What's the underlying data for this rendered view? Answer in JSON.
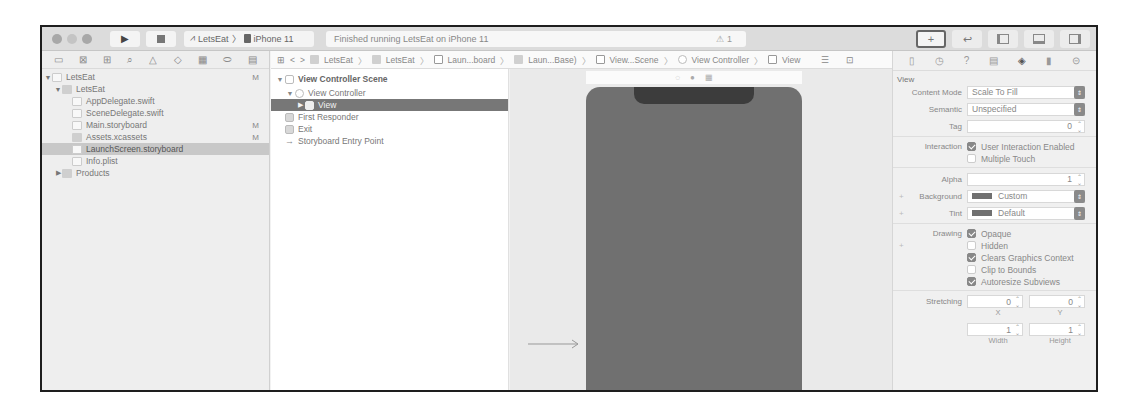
{
  "toolbar": {
    "run_icon": "play-icon",
    "stop_icon": "stop-icon",
    "scheme": {
      "target": "LetsEat",
      "device": "iPhone 11"
    },
    "status": "Finished running LetsEat on iPhone 11",
    "warning_count": "1",
    "right_buttons": [
      "library-icon",
      "code-review-icon",
      "navigator-toggle-icon",
      "debug-area-toggle-icon",
      "inspector-toggle-icon"
    ]
  },
  "navigator": {
    "tab_icons": [
      "folder-icon",
      "source-control-icon",
      "symbol-icon",
      "find-icon",
      "issue-icon",
      "test-icon",
      "debug-icon",
      "breakpoint-icon",
      "report-icon"
    ],
    "items": [
      {
        "label": "LetsEat",
        "level": 0,
        "expanded": true,
        "type": "project",
        "badge": "M"
      },
      {
        "label": "LetsEat",
        "level": 1,
        "expanded": true,
        "type": "folder",
        "badge": ""
      },
      {
        "label": "AppDelegate.swift",
        "level": 2,
        "type": "swift",
        "badge": ""
      },
      {
        "label": "SceneDelegate.swift",
        "level": 2,
        "type": "swift",
        "badge": ""
      },
      {
        "label": "Main.storyboard",
        "level": 2,
        "type": "storyboard",
        "badge": "M"
      },
      {
        "label": "Assets.xcassets",
        "level": 2,
        "type": "assets",
        "badge": "M"
      },
      {
        "label": "LaunchScreen.storyboard",
        "level": 2,
        "type": "storyboard",
        "badge": "",
        "selected": true
      },
      {
        "label": "Info.plist",
        "level": 2,
        "type": "plist",
        "badge": ""
      },
      {
        "label": "Products",
        "level": 1,
        "expanded": false,
        "type": "folder",
        "badge": ""
      }
    ]
  },
  "jumpbar": {
    "back": "<",
    "forward": ">",
    "crumbs": [
      "LetsEat",
      "LetsEat",
      "Laun...board",
      "Laun...Base)",
      "View...Scene",
      "View Controller",
      "View"
    ]
  },
  "outline": {
    "items": [
      {
        "label": "View Controller Scene",
        "level": 0,
        "tri": "▼",
        "bold": true
      },
      {
        "label": "View Controller",
        "level": 1,
        "tri": "▼"
      },
      {
        "label": "View",
        "level": 2,
        "tri": "▶",
        "selected": true
      },
      {
        "label": "First Responder",
        "level": 1,
        "tri": ""
      },
      {
        "label": "Exit",
        "level": 1,
        "tri": ""
      },
      {
        "label": "Storyboard Entry Point",
        "level": 1,
        "tri": "",
        "arrow": "→"
      }
    ]
  },
  "canvas": {
    "device_color": "#707070",
    "dock_icons": [
      "first-responder-icon",
      "view-controller-icon",
      "exit-icon"
    ]
  },
  "inspector": {
    "tab_icons": [
      "file-icon",
      "history-icon",
      "help-icon",
      "identity-icon",
      "attributes-icon",
      "size-icon",
      "connections-icon"
    ],
    "section": "View",
    "content_mode": {
      "label": "Content Mode",
      "value": "Scale To Fill"
    },
    "semantic": {
      "label": "Semantic",
      "value": "Unspecified"
    },
    "tag": {
      "label": "Tag",
      "value": "0"
    },
    "interaction": {
      "label": "Interaction",
      "options": [
        {
          "label": "User Interaction Enabled",
          "checked": true
        },
        {
          "label": "Multiple Touch",
          "checked": false
        }
      ]
    },
    "alpha": {
      "label": "Alpha",
      "value": "1"
    },
    "background": {
      "label": "Background",
      "value": "Custom"
    },
    "tint": {
      "label": "Tint",
      "value": "Default"
    },
    "drawing": {
      "label": "Drawing",
      "options": [
        {
          "label": "Opaque",
          "checked": true
        },
        {
          "label": "Hidden",
          "checked": false
        },
        {
          "label": "Clears Graphics Context",
          "checked": true
        },
        {
          "label": "Clip to Bounds",
          "checked": false
        },
        {
          "label": "Autoresize Subviews",
          "checked": true
        }
      ]
    },
    "stretching": {
      "label": "Stretching",
      "x": "0",
      "y": "0",
      "width": "1",
      "height": "1",
      "x_label": "X",
      "y_label": "Y",
      "width_label": "Width",
      "height_label": "Height"
    }
  }
}
